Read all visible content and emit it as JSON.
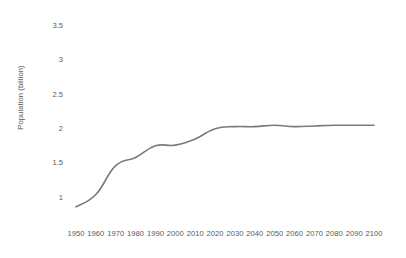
{
  "chart_data": {
    "type": "line",
    "title": "",
    "subtitle": "",
    "xlabel": "",
    "ylabel": "Population (billion)",
    "x": [
      1950,
      1960,
      1970,
      1980,
      1990,
      2000,
      2010,
      2020,
      2030,
      2040,
      2050,
      2060,
      2070,
      2080,
      2090,
      2100
    ],
    "categories": [
      "1950",
      "1960",
      "1970",
      "1980",
      "1990",
      "2000",
      "2010",
      "2020",
      "2030",
      "2040",
      "2050",
      "2060",
      "2070",
      "2080",
      "2090",
      "2100"
    ],
    "values": [
      0.85,
      1.03,
      1.45,
      1.57,
      1.74,
      1.75,
      1.84,
      1.99,
      2.02,
      2.02,
      2.04,
      2.02,
      2.03,
      2.04,
      2.04,
      2.04
    ],
    "series": [
      {
        "name": "Population",
        "values": [
          0.85,
          1.03,
          1.45,
          1.57,
          1.74,
          1.75,
          1.84,
          1.99,
          2.02,
          2.02,
          2.04,
          2.02,
          2.03,
          2.04,
          2.04,
          2.04
        ]
      }
    ],
    "ytick_labels": [
      "3.5",
      "3",
      "2.5",
      "2",
      "1.5",
      "1"
    ],
    "ytick_values": [
      3.5,
      3,
      2.5,
      2,
      1.5,
      1
    ],
    "ylim": [
      0.6,
      3.75
    ],
    "xlim": [
      1945,
      2105
    ],
    "grid": false,
    "legend": false,
    "legend_position": "none",
    "line_color": "#7a7a7a",
    "line_width": 1.6,
    "background_color": "#ffffff",
    "text_color": "#5a5a5a",
    "annotations": []
  }
}
